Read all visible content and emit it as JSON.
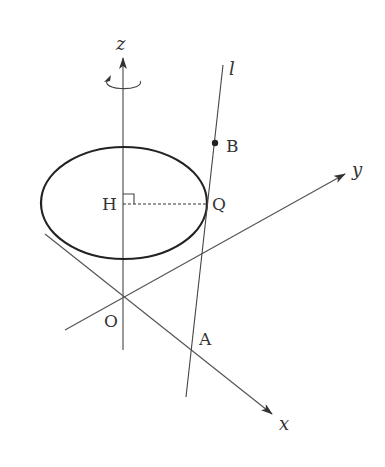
{
  "diagram": {
    "type": "3d-geometry-figure",
    "axes": {
      "x_label": "x",
      "y_label": "y",
      "z_label": "z"
    },
    "line_label": "l",
    "points": {
      "origin": "O",
      "A": "A",
      "B": "B",
      "H": "H",
      "Q": "Q"
    },
    "rotation_indicator": "rotation about z-axis",
    "colors": {
      "stroke": "#333333",
      "axis": "#555555",
      "background": "#ffffff"
    }
  }
}
